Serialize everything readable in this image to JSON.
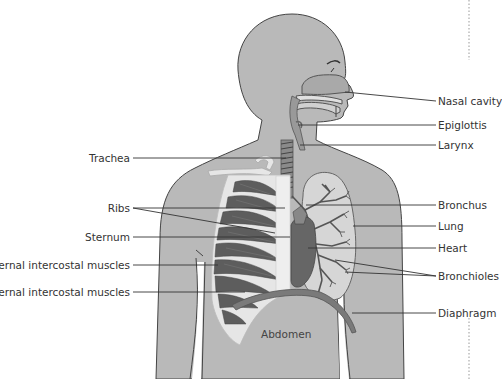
{
  "diagram": {
    "labels_left": [
      {
        "id": "trachea",
        "text": "Trachea",
        "x": 130,
        "y": 155
      },
      {
        "id": "ribs",
        "text": "Ribs",
        "x": 130,
        "y": 205
      },
      {
        "id": "sternum",
        "text": "Sternum",
        "x": 130,
        "y": 234
      },
      {
        "id": "external-intercostal",
        "text": "External intercostal muscles",
        "x": 130,
        "y": 262
      },
      {
        "id": "internal-intercostal",
        "text": "Internal intercostal muscles",
        "x": 130,
        "y": 289
      }
    ],
    "labels_right": [
      {
        "id": "nasal-cavity",
        "text": "Nasal cavity",
        "x": 438,
        "y": 98
      },
      {
        "id": "epiglottis",
        "text": "Epiglottis",
        "x": 438,
        "y": 126
      },
      {
        "id": "larynx",
        "text": "Larynx",
        "x": 438,
        "y": 143
      },
      {
        "id": "bronchus",
        "text": "Bronchus",
        "x": 438,
        "y": 201
      },
      {
        "id": "lung",
        "text": "Lung",
        "x": 438,
        "y": 224
      },
      {
        "id": "heart",
        "text": "Heart",
        "x": 438,
        "y": 245
      },
      {
        "id": "bronchioles",
        "text": "Bronchioles",
        "x": 438,
        "y": 273
      },
      {
        "id": "diaphragm",
        "text": "Diaphragm",
        "x": 438,
        "y": 310
      }
    ],
    "region_label": {
      "id": "abdomen",
      "text": "Abdomen",
      "x": 261,
      "y": 334
    }
  },
  "colors": {
    "skin": "#b9b9b9",
    "outline": "#444444",
    "bone": "#e6e6e6",
    "muscle_dark": "#555555",
    "lung": "#d2d2d2",
    "heart": "#6a6a6a",
    "diaphragm": "#7a7a7a",
    "leader": "#333333"
  }
}
